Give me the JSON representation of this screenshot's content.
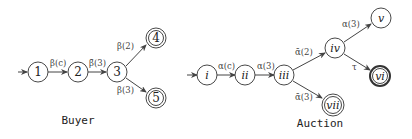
{
  "buyer": {
    "caption": "Buyer",
    "nodes": [
      {
        "id": "1",
        "label": "1",
        "x": 38,
        "y": 72,
        "final": false,
        "initial": true
      },
      {
        "id": "2",
        "label": "2",
        "x": 78,
        "y": 72,
        "final": false
      },
      {
        "id": "3",
        "label": "3",
        "x": 117,
        "y": 72,
        "final": false
      },
      {
        "id": "4",
        "label": "4",
        "x": 156,
        "y": 38,
        "final": true
      },
      {
        "id": "5",
        "label": "5",
        "x": 156,
        "y": 98,
        "final": true
      }
    ],
    "edges": [
      {
        "from": "1",
        "to": "2",
        "label": "β(c)"
      },
      {
        "from": "2",
        "to": "3",
        "label": "β̄(3)"
      },
      {
        "from": "3",
        "to": "4",
        "label": "β(2)"
      },
      {
        "from": "3",
        "to": "5",
        "label": "β(3)"
      }
    ]
  },
  "auction": {
    "caption": "Auction",
    "nodes": [
      {
        "id": "i",
        "label": "i",
        "x": 207,
        "y": 75,
        "initial": true
      },
      {
        "id": "ii",
        "label": "ii",
        "x": 245,
        "y": 75
      },
      {
        "id": "iii",
        "label": "iii",
        "x": 284,
        "y": 75
      },
      {
        "id": "iv",
        "label": "iv",
        "x": 335,
        "y": 48
      },
      {
        "id": "v",
        "label": "v",
        "x": 381,
        "y": 18
      },
      {
        "id": "vi",
        "label": "vi",
        "x": 380,
        "y": 76,
        "final": true
      },
      {
        "id": "vii",
        "label": "vii",
        "x": 333,
        "y": 105,
        "final": true
      }
    ],
    "edges": [
      {
        "from": "i",
        "to": "ii",
        "label": "α(c)"
      },
      {
        "from": "ii",
        "to": "iii",
        "label": "α(3)"
      },
      {
        "from": "iii",
        "to": "iv",
        "label": "ᾱ(2)"
      },
      {
        "from": "iii",
        "to": "vii",
        "label": "ᾱ(3)"
      },
      {
        "from": "iv",
        "to": "v",
        "label": "α(3)"
      },
      {
        "from": "iv",
        "to": "vi",
        "label": "τ"
      }
    ]
  }
}
